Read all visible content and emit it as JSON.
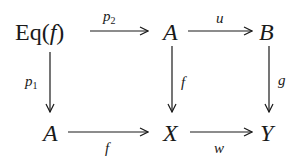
{
  "diagram": {
    "type": "commutative-diagram",
    "nodes": {
      "eq": {
        "prefix": "Eq(",
        "var": "f",
        "suffix": ")"
      },
      "a_top": "A",
      "b": "B",
      "a_bottom": "A",
      "x": "X",
      "y": "Y"
    },
    "arrows": {
      "p2": {
        "letter": "p",
        "sub": "2",
        "from": "Eq(f)",
        "to": "A"
      },
      "u": {
        "label": "u",
        "from": "A",
        "to": "B"
      },
      "p1": {
        "letter": "p",
        "sub": "1",
        "from": "Eq(f)",
        "to": "A"
      },
      "f_vert": {
        "label": "f",
        "from": "A",
        "to": "X"
      },
      "g": {
        "label": "g",
        "from": "B",
        "to": "Y"
      },
      "f_horiz": {
        "label": "f",
        "from": "A",
        "to": "X"
      },
      "w": {
        "label": "w",
        "from": "X",
        "to": "Y"
      }
    },
    "colors": {
      "ink": "#1a1a1a",
      "background": "#ffffff"
    }
  }
}
